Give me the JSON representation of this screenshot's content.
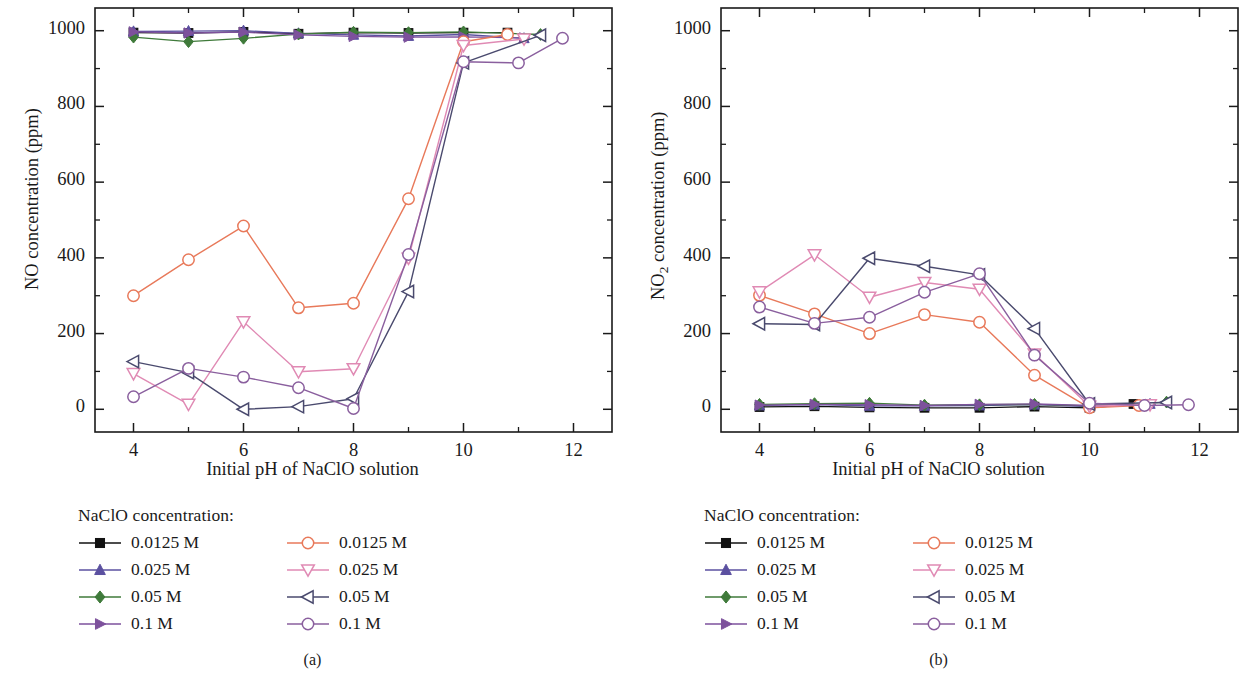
{
  "figure": {
    "panels": [
      {
        "caption": "(a)",
        "ylabel_main": "NO",
        "ylabel_sub": "",
        "ylabel_tail": " concentration (ppm)",
        "xlabel": "Initial pH of NaClO solution",
        "legend_title": "NaClO concentration:",
        "legend_left": [
          "0.0125 M",
          "0.025 M",
          "0.05 M",
          "0.1 M"
        ],
        "legend_right": [
          "0.0125 M",
          "0.025 M",
          "0.05 M",
          "0.1 M"
        ],
        "xticks": [
          "4",
          "6",
          "8",
          "10",
          "12"
        ],
        "yticks": [
          "0",
          "200",
          "400",
          "600",
          "800",
          "1000"
        ]
      },
      {
        "caption": "(b)",
        "ylabel_main": "NO",
        "ylabel_sub": "2",
        "ylabel_tail": " concentration (ppm)",
        "xlabel": "Initial pH of NaClO solution",
        "legend_title": "NaClO concentration:",
        "legend_left": [
          "0.0125 M",
          "0.025 M",
          "0.05 M",
          "0.1 M"
        ],
        "legend_right": [
          "0.0125 M",
          "0.025 M",
          "0.05 M",
          "0.1 M"
        ],
        "xticks": [
          "4",
          "6",
          "8",
          "10",
          "12"
        ],
        "yticks": [
          "0",
          "200",
          "400",
          "600",
          "800",
          "1000"
        ]
      }
    ]
  },
  "colors": {
    "filled_square": "#111111",
    "filled_triangle_up": "#5b50a0",
    "filled_diamond": "#3f7a3a",
    "filled_triangle_right": "#7d519c",
    "open_circle_orange": "#e8795a",
    "open_triangle_down": "#e08ab4",
    "open_triangle_left": "#4a4a6e",
    "open_circle_purple": "#8a5f9e",
    "axis": "#1a1a1a",
    "background": "#ffffff"
  },
  "chart_data": [
    {
      "type": "line",
      "panel": "a",
      "title": "",
      "xlabel": "Initial pH of NaClO solution",
      "ylabel": "NO concentration (ppm)",
      "xlim": [
        3.3,
        12.7
      ],
      "ylim": [
        -60,
        1060
      ],
      "xticks": [
        4,
        6,
        8,
        10,
        12
      ],
      "yticks": [
        0,
        200,
        400,
        600,
        800,
        1000
      ],
      "grid": false,
      "legend_position": "below-left",
      "series": [
        {
          "name": "0.0125 M",
          "marker": "filled-square",
          "color": "#111111",
          "x": [
            4,
            5,
            6,
            7,
            8,
            9,
            10,
            10.8
          ],
          "y": [
            995,
            994,
            997,
            992,
            995,
            994,
            995,
            995
          ]
        },
        {
          "name": "0.025 M",
          "marker": "filled-triangle-up",
          "color": "#5b50a0",
          "x": [
            4,
            5,
            6,
            7,
            8,
            9,
            10,
            11.1
          ],
          "y": [
            998,
            999,
            1000,
            993,
            989,
            986,
            990,
            980
          ]
        },
        {
          "name": "0.05 M",
          "marker": "filled-diamond",
          "color": "#3f7a3a",
          "x": [
            4,
            5,
            6,
            7,
            8,
            9,
            10,
            11.4
          ],
          "y": [
            983,
            971,
            980,
            991,
            996,
            995,
            997,
            990
          ]
        },
        {
          "name": "0.1 M",
          "marker": "filled-triangle-right",
          "color": "#7d519c",
          "x": [
            4,
            5,
            6,
            7,
            8,
            9,
            10,
            11.1
          ],
          "y": [
            997,
            994,
            996,
            989,
            985,
            983,
            984,
            981
          ]
        },
        {
          "name": "0.0125 M (open)",
          "marker": "open-circle",
          "color": "#e8795a",
          "x": [
            4,
            5,
            6,
            7,
            8,
            9,
            10,
            10.8
          ],
          "y": [
            300,
            395,
            484,
            268,
            280,
            556,
            971,
            990
          ]
        },
        {
          "name": "0.025 M (open)",
          "marker": "open-triangle-down",
          "color": "#e08ab4",
          "x": [
            4,
            5,
            6,
            7,
            8,
            9,
            10,
            11.1
          ],
          "y": [
            94,
            13,
            231,
            99,
            107,
            399,
            961,
            978
          ]
        },
        {
          "name": "0.05 M (open)",
          "marker": "open-triangle-left",
          "color": "#4a4a6e",
          "x": [
            4,
            5,
            6,
            7,
            8,
            9,
            10,
            11.4
          ],
          "y": [
            126,
            97,
            0,
            7,
            28,
            311,
            915,
            988
          ]
        },
        {
          "name": "0.1 M (open)",
          "marker": "open-circle",
          "color": "#8a5f9e",
          "x": [
            4,
            5,
            6,
            7,
            8,
            9,
            10,
            11.0,
            11.8
          ],
          "y": [
            33,
            108,
            85,
            57,
            2,
            409,
            918,
            915,
            980
          ]
        }
      ]
    },
    {
      "type": "line",
      "panel": "b",
      "title": "",
      "xlabel": "Initial pH of NaClO solution",
      "ylabel": "NO2 concentration (ppm)",
      "xlim": [
        3.3,
        12.7
      ],
      "ylim": [
        -60,
        1060
      ],
      "xticks": [
        4,
        6,
        8,
        10,
        12
      ],
      "yticks": [
        0,
        200,
        400,
        600,
        800,
        1000
      ],
      "grid": false,
      "legend_position": "below-left",
      "series": [
        {
          "name": "0.0125 M",
          "marker": "filled-square",
          "color": "#111111",
          "x": [
            4,
            5,
            6,
            7,
            8,
            9,
            10,
            10.8
          ],
          "y": [
            6,
            8,
            5,
            4,
            4,
            7,
            4,
            14
          ]
        },
        {
          "name": "0.025 M",
          "marker": "filled-triangle-up",
          "color": "#5b50a0",
          "x": [
            4,
            5,
            6,
            7,
            8,
            9,
            10,
            11.1
          ],
          "y": [
            10,
            12,
            9,
            9,
            10,
            12,
            7,
            14
          ]
        },
        {
          "name": "0.05 M",
          "marker": "filled-diamond",
          "color": "#3f7a3a",
          "x": [
            4,
            5,
            6,
            7,
            8,
            9,
            10,
            11.4
          ],
          "y": [
            13,
            15,
            16,
            11,
            12,
            13,
            9,
            19
          ]
        },
        {
          "name": "0.1 M",
          "marker": "filled-triangle-right",
          "color": "#7d519c",
          "x": [
            4,
            5,
            6,
            7,
            8,
            9,
            10,
            11.1
          ],
          "y": [
            11,
            13,
            12,
            10,
            13,
            14,
            10,
            13
          ]
        },
        {
          "name": "0.0125 M (open)",
          "marker": "open-circle",
          "color": "#e8795a",
          "x": [
            4,
            5,
            6,
            7,
            8,
            9,
            10,
            10.9
          ],
          "y": [
            301,
            252,
            200,
            250,
            230,
            90,
            4,
            10
          ]
        },
        {
          "name": "0.025 M (open)",
          "marker": "open-triangle-down",
          "color": "#e08ab4",
          "x": [
            4,
            5,
            6,
            7,
            8,
            9,
            10,
            11.1
          ],
          "y": [
            310,
            408,
            296,
            335,
            317,
            146,
            8,
            12
          ]
        },
        {
          "name": "0.05 M (open)",
          "marker": "open-triangle-left",
          "color": "#4a4a6e",
          "x": [
            4,
            5,
            6,
            7,
            8,
            9,
            10,
            11.4
          ],
          "y": [
            226,
            224,
            399,
            378,
            355,
            213,
            14,
            18
          ]
        },
        {
          "name": "0.1 M (open)",
          "marker": "open-circle",
          "color": "#8a5f9e",
          "x": [
            4,
            5,
            6,
            7,
            8,
            9,
            10,
            11.0,
            11.8
          ],
          "y": [
            270,
            227,
            243,
            309,
            358,
            143,
            16,
            10,
            12
          ]
        }
      ]
    }
  ]
}
